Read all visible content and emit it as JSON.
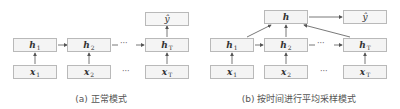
{
  "diagram_a": {
    "caption": "(a) 正常模式",
    "output": "ŷ",
    "hidden": [
      {
        "base": "h",
        "sub": "1"
      },
      {
        "base": "h",
        "sub": "2"
      },
      {
        "base": "h",
        "sub": "T"
      }
    ],
    "inputs": [
      {
        "base": "x",
        "sub": "1"
      },
      {
        "base": "x",
        "sub": "2"
      },
      {
        "base": "x",
        "sub": "T"
      }
    ],
    "ellipsis": "···"
  },
  "diagram_b": {
    "caption": "(b) 按时间进行平均采样模式",
    "pool": "h",
    "output": "ŷ",
    "hidden": [
      {
        "base": "h",
        "sub": "1"
      },
      {
        "base": "h",
        "sub": "2"
      },
      {
        "base": "h",
        "sub": "T"
      }
    ],
    "inputs": [
      {
        "base": "x",
        "sub": "1"
      },
      {
        "base": "x",
        "sub": "2"
      },
      {
        "base": "x",
        "sub": "T"
      }
    ],
    "ellipsis": "···"
  },
  "colors": {
    "box_border": "#b9b9b9",
    "box_fill": "#f4f4f4",
    "arrow": "#555555",
    "caption": "#555555"
  }
}
